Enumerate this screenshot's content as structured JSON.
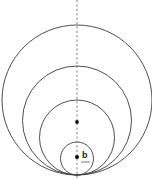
{
  "diagram": {
    "background_color": "#ffffff",
    "stroke_color": "#3a3a3a",
    "axis_color": "#6e6e6e",
    "dot_color": "#111111",
    "label_text": "b",
    "tangent_point": {
      "x": 77,
      "y": 175
    },
    "axis": {
      "name": "vertical-axis-of-symmetry",
      "x": 77,
      "y_top": 0,
      "y_bottom": 180,
      "style": "dashed"
    },
    "circles": [
      {
        "name": "outer-circle",
        "cx": 77,
        "cy": 100.0,
        "r": 75.0,
        "top_y": 25.0
      },
      {
        "name": "second-circle",
        "cx": 77,
        "cy": 120.5,
        "r": 54.5,
        "top_y": 66.0
      },
      {
        "name": "third-circle",
        "cx": 77,
        "cy": 137.5,
        "r": 37.5,
        "top_y": 100.0
      },
      {
        "name": "innermost-circle",
        "cx": 77,
        "cy": 158.5,
        "r": 16.5,
        "top_y": 142.0
      }
    ],
    "points": [
      {
        "name": "upper-center-dot",
        "x": 77,
        "y": 122,
        "r": 1.9
      },
      {
        "name": "lower-center-dot",
        "x": 77,
        "y": 157,
        "r": 2.1
      }
    ],
    "marks": [
      {
        "name": "underline-tick",
        "x1": 81,
        "y1": 162,
        "x2": 90,
        "y2": 162
      }
    ],
    "label": {
      "name": "inner-glyph-label",
      "x": 82,
      "y": 158,
      "text": "b"
    }
  }
}
